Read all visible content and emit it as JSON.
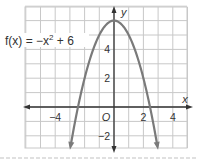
{
  "chart_data": {
    "type": "line",
    "title": "",
    "function_label": "f(x) = −x² + 6",
    "function_parts": {
      "prefix": "f(x) = −x",
      "exp": "2",
      "suffix": " + 6"
    },
    "xlabel": "x",
    "ylabel": "y",
    "origin_label": "O",
    "xlim": [
      -6,
      5
    ],
    "ylim": [
      -3,
      7
    ],
    "x_ticks": [
      {
        "value": -4,
        "label": "−4"
      },
      {
        "value": 2,
        "label": "2"
      },
      {
        "value": 4,
        "label": "4"
      }
    ],
    "y_ticks": [
      {
        "value": 4,
        "label": "4"
      },
      {
        "value": 2,
        "label": "2"
      },
      {
        "value": -2,
        "label": "−2"
      }
    ],
    "grid": true,
    "series": [
      {
        "name": "f(x) = −x² + 6",
        "x": [
          -3,
          -2.5,
          -2,
          -1.5,
          -1,
          -0.5,
          0,
          0.5,
          1,
          1.5,
          2,
          2.5,
          3
        ],
        "y": [
          -3,
          -0.25,
          2,
          3.75,
          5,
          5.75,
          6,
          5.75,
          5,
          3.75,
          2,
          -0.25,
          -3
        ],
        "color": "#7a7a7a"
      }
    ],
    "colors": {
      "grid": "#c8c8c8",
      "axis": "#333333",
      "curve": "#7a7a7a",
      "dashed_rule": "#d0d0d0"
    }
  }
}
